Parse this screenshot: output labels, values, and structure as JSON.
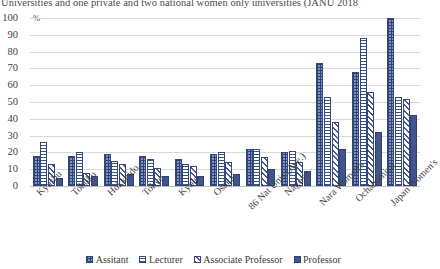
{
  "caption": {
    "text": "Universities and one private and two national women only universities (JANU 2018"
  },
  "chart_data": {
    "type": "bar",
    "title": "",
    "xlabel": "",
    "ylabel": "%",
    "ylim": [
      0,
      100
    ],
    "ytick_step": 10,
    "yticks": [
      100,
      90,
      80,
      70,
      60,
      50,
      40,
      30,
      20,
      10,
      0
    ],
    "grid": true,
    "legend_position": "bottom",
    "categories": [
      "Kyushu",
      "Tohoku",
      "Hokkaido",
      "Tokyo",
      "Kyoto",
      "Osaka",
      "86 Nat Unis (Ave.)",
      "Nagoya",
      "Nara Women's",
      "Ochanomizu",
      "Japan Women's"
    ],
    "series": [
      {
        "name": "Assitant",
        "pattern": "checkered",
        "color": "#8494bd",
        "values": [
          18,
          18,
          19,
          18,
          16,
          19,
          22,
          20,
          73,
          68,
          100
        ]
      },
      {
        "name": "Lecturer",
        "pattern": "horizontal-lines",
        "color": "#ffffff",
        "values": [
          26,
          20,
          15,
          16,
          13,
          20,
          22,
          21,
          53,
          88,
          53
        ]
      },
      {
        "name": "Associate Professor",
        "pattern": "diagonal-stripes",
        "color": "#ffffff",
        "values": [
          13,
          8,
          13,
          11,
          12,
          14,
          17,
          14,
          38,
          56,
          52
        ]
      },
      {
        "name": "Professor",
        "pattern": "solid",
        "color": "#41558c",
        "values": [
          5,
          6,
          7,
          6,
          6,
          7,
          10,
          9,
          22,
          32,
          42
        ]
      }
    ]
  }
}
